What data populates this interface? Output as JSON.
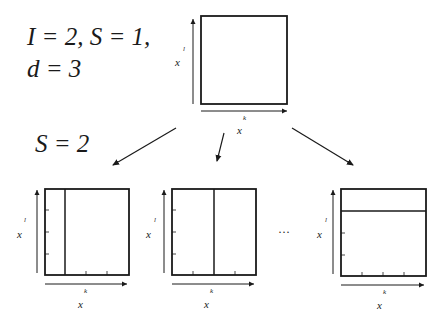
{
  "header": {
    "params_line1": "I = 2, S = 1,",
    "params_line2": "d = 3",
    "split_label": "S = 2"
  },
  "top_grid": {
    "x_axis_label": "x",
    "x_axis_sup": "k",
    "y_axis_label": "x",
    "y_axis_sup": "l"
  },
  "children": [
    {
      "x_axis_label": "x",
      "x_axis_sup": "k",
      "y_axis_label": "x",
      "y_axis_sup": "l",
      "split": "vertical-left"
    },
    {
      "x_axis_label": "x",
      "x_axis_sup": "k",
      "y_axis_label": "x",
      "y_axis_sup": "l",
      "split": "vertical-middle"
    },
    {
      "x_axis_label": "x",
      "x_axis_sup": "k",
      "y_axis_label": "x",
      "y_axis_sup": "l",
      "split": "horizontal-top"
    }
  ],
  "ellipsis": "···",
  "colors": {
    "stroke": "#1a1a1a",
    "background": "#ffffff"
  }
}
